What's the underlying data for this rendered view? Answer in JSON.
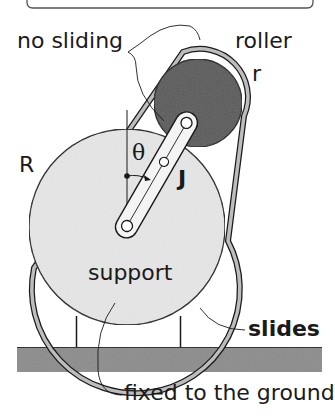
{
  "diagram": {
    "title_box": "",
    "labels": {
      "no_sliding": "no sliding",
      "roller": "roller",
      "roller_radius": "r",
      "support_radius": "R",
      "angle": "θ",
      "inertia": "J",
      "support": "support",
      "slides": "slides",
      "fixed": "fixed to the ground"
    },
    "colors": {
      "support_fill": "#e6e6e6",
      "roller_fill": "#5a5a5a",
      "belt": "#bdbdbd",
      "ground": "#8c8c8c",
      "ink": "#1a1a1a"
    }
  }
}
